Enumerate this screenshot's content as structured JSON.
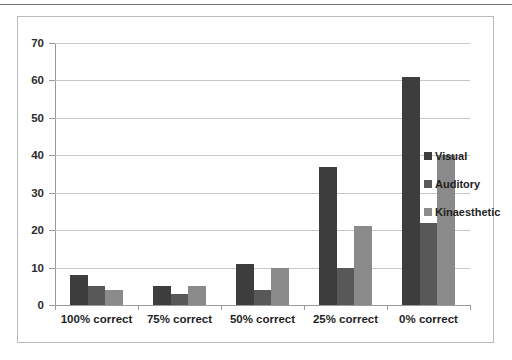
{
  "chart_data": {
    "type": "bar",
    "title": "",
    "subtitle": "",
    "xlabel": "",
    "ylabel": "",
    "categories": [
      "100% correct",
      "75% correct",
      "50% correct",
      "25% correct",
      "0% correct"
    ],
    "series": [
      {
        "name": "Visual",
        "color": "#3d3d3d",
        "values": [
          8,
          5,
          11,
          37,
          61
        ]
      },
      {
        "name": "Auditory",
        "color": "#585858",
        "values": [
          5,
          3,
          4,
          10,
          22
        ]
      },
      {
        "name": "Kinaesthetic",
        "color": "#8a8a8a",
        "values": [
          4,
          5,
          10,
          21,
          40
        ]
      }
    ],
    "ylim": [
      0,
      70
    ],
    "ytick_step": 10,
    "yticks": [
      0,
      10,
      20,
      30,
      40,
      50,
      60,
      70
    ],
    "ytick_labels": [
      "0",
      "10",
      "20",
      "30",
      "40",
      "50",
      "60",
      "70"
    ],
    "grid": "horizontal",
    "legend_position": "right",
    "legend_entries": [
      "Visual",
      "Auditory",
      "Kinaesthetic"
    ],
    "frame_color": "#b9b9b9",
    "gridline_color": "#c6c6c6",
    "axis_color": "#9a9a9a",
    "background": "#ffffff"
  }
}
